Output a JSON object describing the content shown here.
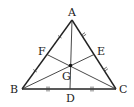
{
  "diagram": {
    "type": "triangle-medians-centroid",
    "points": {
      "A": {
        "label": "A",
        "x": 72,
        "y": 20
      },
      "B": {
        "label": "B",
        "x": 22,
        "y": 89
      },
      "C": {
        "label": "C",
        "x": 116,
        "y": 89
      },
      "D": {
        "label": "D",
        "x": 69,
        "y": 89
      },
      "E": {
        "label": "E",
        "x": 94,
        "y": 54.5
      },
      "F": {
        "label": "F",
        "x": 47,
        "y": 54.5
      },
      "G": {
        "label": "G",
        "x": 70,
        "y": 66
      }
    },
    "labels": {
      "A": "A",
      "B": "B",
      "C": "C",
      "D": "D",
      "E": "E",
      "F": "F",
      "G": "G"
    },
    "segments": [
      "AB",
      "BC",
      "CA",
      "AD",
      "BE",
      "CF"
    ],
    "tick_marks": {
      "AF": 1,
      "FB": 1,
      "AE": 2,
      "EC": 2,
      "BD": 2,
      "DC": 2
    },
    "colors": {
      "stroke": "#222222",
      "background": "#ffffff"
    }
  }
}
